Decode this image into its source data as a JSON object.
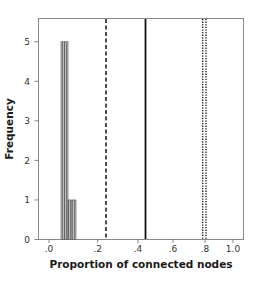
{
  "chart_data": {
    "type": "bar",
    "subtype": "histogram",
    "title": "",
    "xlabel": "Proportion of connected nodes",
    "ylabel": "Frequency",
    "xlim": [
      -0.05,
      1.1
    ],
    "ylim": [
      0,
      5.5
    ],
    "x_scale": "nonlinear (square-root-like spacing)",
    "x_ticks": [
      0.0,
      0.2,
      0.4,
      0.6,
      0.8,
      1.0
    ],
    "x_tick_labels": [
      ".0",
      ".2",
      ".4",
      ".6",
      ".8",
      "1.0"
    ],
    "y_ticks": [
      0,
      1,
      2,
      3,
      4,
      5
    ],
    "y_tick_labels": [
      "0",
      "1",
      "2",
      "3",
      "4",
      "5"
    ],
    "grid": false,
    "legend": null,
    "bins": [
      {
        "x_start": 0.05,
        "x_end": 0.062,
        "frequency": 5
      },
      {
        "x_start": 0.062,
        "x_end": 0.075,
        "frequency": 5
      },
      {
        "x_start": 0.075,
        "x_end": 0.088,
        "frequency": 1
      },
      {
        "x_start": 0.088,
        "x_end": 0.101,
        "frequency": 0
      },
      {
        "x_start": 0.101,
        "x_end": 0.115,
        "frequency": 1
      }
    ],
    "reference_lines": [
      {
        "x": 0.24,
        "style": "dashed",
        "color": "#222222"
      },
      {
        "x": 0.44,
        "style": "solid",
        "color": "#111111"
      },
      {
        "x": 0.79,
        "style": "dotted",
        "color": "#222222"
      },
      {
        "x": 0.81,
        "style": "dotted",
        "color": "#222222"
      }
    ],
    "bar_fill": "#a8a8a8",
    "bar_stroke": "#555555"
  },
  "axes": {
    "x_title": "Proportion of connected nodes",
    "y_title": "Frequency"
  }
}
